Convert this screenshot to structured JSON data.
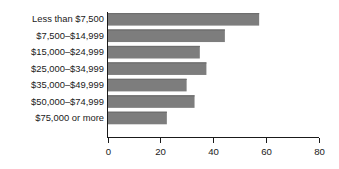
{
  "chart_data": {
    "type": "bar",
    "orientation": "horizontal",
    "title": "",
    "subtitle": "",
    "xlabel": "",
    "ylabel": "",
    "categories": [
      "Less than $7,500",
      "$7,500–$14,999",
      "$15,000–$24,999",
      "$25,000–$34,999",
      "$35,000–$49,999",
      "$50,000–$74,999",
      "$75,000 or more"
    ],
    "values": [
      57.5,
      44.5,
      35.0,
      37.5,
      30.0,
      33.0,
      22.5
    ],
    "xlim": [
      0,
      80
    ],
    "xticks": [
      0,
      20,
      40,
      60,
      80
    ],
    "xtick_labels": [
      "0",
      "20",
      "40",
      "60",
      "80"
    ],
    "grid": false,
    "legend": false,
    "legend_position": "none",
    "bar_color": "#7d7d7d",
    "axis_color": "#1a1a1a",
    "background_color": "#ffffff"
  }
}
